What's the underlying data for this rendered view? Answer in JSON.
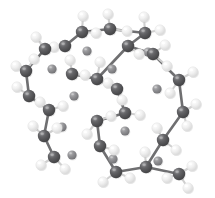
{
  "figure": {
    "kind": "ball-and-stick-molecular-model",
    "background_color": "#ffffff",
    "width": 215,
    "height": 198
  },
  "palette": {
    "carbon_fill": "#58585a",
    "carbon_dark": "#3f3f41",
    "carbon_highlight": "#8d8d90",
    "hydrogen_fill": "#ececec",
    "hydrogen_dark": "#d2d2d2",
    "hydrogen_highlight": "#ffffff",
    "interstitial_fill": "#8b8b8d",
    "interstitial_dark": "#6e6e70",
    "interstitial_highlight": "#b4b4b6",
    "bond_color": "#6f6f71",
    "bond_light": "#cfcfcf"
  },
  "atom_types": {
    "carbon": {
      "label": "C",
      "radius": 6.2,
      "color": "#58585a"
    },
    "hydrogen": {
      "label": "H",
      "radius": 5.2,
      "color": "#ececec"
    },
    "interstitial": {
      "label": "M",
      "radius": 4.6,
      "color": "#8b8b8d"
    }
  },
  "atoms": [
    {
      "id": 0,
      "element": "carbon",
      "x": 82,
      "y": 32
    },
    {
      "id": 1,
      "element": "carbon",
      "x": 110,
      "y": 29
    },
    {
      "id": 2,
      "element": "carbon",
      "x": 145,
      "y": 33
    },
    {
      "id": 3,
      "element": "carbon",
      "x": 45,
      "y": 49
    },
    {
      "id": 4,
      "element": "carbon",
      "x": 65,
      "y": 46
    },
    {
      "id": 5,
      "element": "carbon",
      "x": 128,
      "y": 46
    },
    {
      "id": 6,
      "element": "carbon",
      "x": 153,
      "y": 54
    },
    {
      "id": 7,
      "element": "carbon",
      "x": 26,
      "y": 71
    },
    {
      "id": 8,
      "element": "carbon",
      "x": 72,
      "y": 74
    },
    {
      "id": 9,
      "element": "carbon",
      "x": 97,
      "y": 79
    },
    {
      "id": 10,
      "element": "carbon",
      "x": 117,
      "y": 89
    },
    {
      "id": 11,
      "element": "carbon",
      "x": 179,
      "y": 80
    },
    {
      "id": 12,
      "element": "carbon",
      "x": 29,
      "y": 96
    },
    {
      "id": 13,
      "element": "carbon",
      "x": 49,
      "y": 110
    },
    {
      "id": 14,
      "element": "carbon",
      "x": 125,
      "y": 113
    },
    {
      "id": 15,
      "element": "carbon",
      "x": 183,
      "y": 112
    },
    {
      "id": 16,
      "element": "carbon",
      "x": 44,
      "y": 136
    },
    {
      "id": 17,
      "element": "carbon",
      "x": 97,
      "y": 121
    },
    {
      "id": 18,
      "element": "carbon",
      "x": 100,
      "y": 146
    },
    {
      "id": 19,
      "element": "carbon",
      "x": 54,
      "y": 157
    },
    {
      "id": 20,
      "element": "carbon",
      "x": 163,
      "y": 140
    },
    {
      "id": 21,
      "element": "carbon",
      "x": 116,
      "y": 172
    },
    {
      "id": 22,
      "element": "carbon",
      "x": 146,
      "y": 167
    },
    {
      "id": 23,
      "element": "carbon",
      "x": 179,
      "y": 174
    },
    {
      "id": 24,
      "element": "hydrogen",
      "x": 83,
      "y": 16
    },
    {
      "id": 25,
      "element": "hydrogen",
      "x": 108,
      "y": 14
    },
    {
      "id": 26,
      "element": "hydrogen",
      "x": 144,
      "y": 17
    },
    {
      "id": 27,
      "element": "hydrogen",
      "x": 160,
      "y": 30
    },
    {
      "id": 28,
      "element": "hydrogen",
      "x": 96,
      "y": 33
    },
    {
      "id": 29,
      "element": "hydrogen",
      "x": 127,
      "y": 31
    },
    {
      "id": 30,
      "element": "hydrogen",
      "x": 36,
      "y": 37
    },
    {
      "id": 31,
      "element": "hydrogen",
      "x": 54,
      "y": 47
    },
    {
      "id": 32,
      "element": "hydrogen",
      "x": 70,
      "y": 60
    },
    {
      "id": 33,
      "element": "hydrogen",
      "x": 100,
      "y": 62
    },
    {
      "id": 34,
      "element": "hydrogen",
      "x": 139,
      "y": 54
    },
    {
      "id": 35,
      "element": "hydrogen",
      "x": 165,
      "y": 45
    },
    {
      "id": 36,
      "element": "hydrogen",
      "x": 167,
      "y": 66
    },
    {
      "id": 37,
      "element": "hydrogen",
      "x": 16,
      "y": 66
    },
    {
      "id": 38,
      "element": "hydrogen",
      "x": 34,
      "y": 59
    },
    {
      "id": 39,
      "element": "hydrogen",
      "x": 85,
      "y": 75
    },
    {
      "id": 40,
      "element": "hydrogen",
      "x": 108,
      "y": 83
    },
    {
      "id": 41,
      "element": "hydrogen",
      "x": 193,
      "y": 72
    },
    {
      "id": 42,
      "element": "hydrogen",
      "x": 170,
      "y": 93
    },
    {
      "id": 43,
      "element": "hydrogen",
      "x": 17,
      "y": 87
    },
    {
      "id": 44,
      "element": "hydrogen",
      "x": 40,
      "y": 102
    },
    {
      "id": 45,
      "element": "hydrogen",
      "x": 63,
      "y": 106
    },
    {
      "id": 46,
      "element": "hydrogen",
      "x": 122,
      "y": 100
    },
    {
      "id": 47,
      "element": "hydrogen",
      "x": 140,
      "y": 115
    },
    {
      "id": 48,
      "element": "hydrogen",
      "x": 196,
      "y": 104
    },
    {
      "id": 49,
      "element": "hydrogen",
      "x": 187,
      "y": 126
    },
    {
      "id": 50,
      "element": "hydrogen",
      "x": 33,
      "y": 126
    },
    {
      "id": 51,
      "element": "hydrogen",
      "x": 57,
      "y": 128
    },
    {
      "id": 52,
      "element": "hydrogen",
      "x": 111,
      "y": 116
    },
    {
      "id": 53,
      "element": "hydrogen",
      "x": 87,
      "y": 134
    },
    {
      "id": 54,
      "element": "hydrogen",
      "x": 114,
      "y": 150
    },
    {
      "id": 55,
      "element": "hydrogen",
      "x": 41,
      "y": 165
    },
    {
      "id": 56,
      "element": "hydrogen",
      "x": 65,
      "y": 169
    },
    {
      "id": 57,
      "element": "hydrogen",
      "x": 157,
      "y": 128
    },
    {
      "id": 58,
      "element": "hydrogen",
      "x": 176,
      "y": 150
    },
    {
      "id": 59,
      "element": "hydrogen",
      "x": 103,
      "y": 182
    },
    {
      "id": 60,
      "element": "hydrogen",
      "x": 130,
      "y": 178
    },
    {
      "id": 61,
      "element": "hydrogen",
      "x": 145,
      "y": 152
    },
    {
      "id": 62,
      "element": "hydrogen",
      "x": 167,
      "y": 178
    },
    {
      "id": 63,
      "element": "hydrogen",
      "x": 192,
      "y": 166
    },
    {
      "id": 64,
      "element": "hydrogen",
      "x": 188,
      "y": 188
    },
    {
      "id": 65,
      "element": "interstitial",
      "x": 87,
      "y": 51
    },
    {
      "id": 66,
      "element": "interstitial",
      "x": 112,
      "y": 69
    },
    {
      "id": 67,
      "element": "interstitial",
      "x": 52,
      "y": 69
    },
    {
      "id": 68,
      "element": "interstitial",
      "x": 148,
      "y": 52
    },
    {
      "id": 69,
      "element": "interstitial",
      "x": 157,
      "y": 89
    },
    {
      "id": 70,
      "element": "interstitial",
      "x": 74,
      "y": 96
    },
    {
      "id": 71,
      "element": "interstitial",
      "x": 62,
      "y": 127
    },
    {
      "id": 72,
      "element": "interstitial",
      "x": 72,
      "y": 155
    },
    {
      "id": 73,
      "element": "interstitial",
      "x": 125,
      "y": 131
    },
    {
      "id": 74,
      "element": "interstitial",
      "x": 113,
      "y": 159
    },
    {
      "id": 75,
      "element": "interstitial",
      "x": 158,
      "y": 161
    }
  ],
  "bonds": [
    {
      "from": 0,
      "to": 1
    },
    {
      "from": 1,
      "to": 2
    },
    {
      "from": 0,
      "to": 4
    },
    {
      "from": 4,
      "to": 3
    },
    {
      "from": 3,
      "to": 7
    },
    {
      "from": 7,
      "to": 12
    },
    {
      "from": 12,
      "to": 13
    },
    {
      "from": 13,
      "to": 16
    },
    {
      "from": 16,
      "to": 19
    },
    {
      "from": 2,
      "to": 5
    },
    {
      "from": 5,
      "to": 6
    },
    {
      "from": 6,
      "to": 11
    },
    {
      "from": 11,
      "to": 15
    },
    {
      "from": 15,
      "to": 20
    },
    {
      "from": 20,
      "to": 22
    },
    {
      "from": 22,
      "to": 23
    },
    {
      "from": 5,
      "to": 9
    },
    {
      "from": 8,
      "to": 9
    },
    {
      "from": 9,
      "to": 10
    },
    {
      "from": 10,
      "to": 14
    },
    {
      "from": 14,
      "to": 17
    },
    {
      "from": 17,
      "to": 18
    },
    {
      "from": 18,
      "to": 21
    },
    {
      "from": 21,
      "to": 22
    },
    {
      "from": 0,
      "to": 24
    },
    {
      "from": 1,
      "to": 25
    },
    {
      "from": 2,
      "to": 26
    },
    {
      "from": 2,
      "to": 27
    },
    {
      "from": 0,
      "to": 28
    },
    {
      "from": 1,
      "to": 29
    },
    {
      "from": 3,
      "to": 30
    },
    {
      "from": 4,
      "to": 31
    },
    {
      "from": 8,
      "to": 32
    },
    {
      "from": 9,
      "to": 33
    },
    {
      "from": 5,
      "to": 34
    },
    {
      "from": 6,
      "to": 35
    },
    {
      "from": 6,
      "to": 36
    },
    {
      "from": 7,
      "to": 37
    },
    {
      "from": 7,
      "to": 38
    },
    {
      "from": 8,
      "to": 39
    },
    {
      "from": 10,
      "to": 40
    },
    {
      "from": 11,
      "to": 41
    },
    {
      "from": 11,
      "to": 42
    },
    {
      "from": 12,
      "to": 43
    },
    {
      "from": 13,
      "to": 44
    },
    {
      "from": 13,
      "to": 45
    },
    {
      "from": 10,
      "to": 46
    },
    {
      "from": 14,
      "to": 47
    },
    {
      "from": 15,
      "to": 48
    },
    {
      "from": 15,
      "to": 49
    },
    {
      "from": 16,
      "to": 50
    },
    {
      "from": 16,
      "to": 51
    },
    {
      "from": 17,
      "to": 52
    },
    {
      "from": 17,
      "to": 53
    },
    {
      "from": 18,
      "to": 54
    },
    {
      "from": 19,
      "to": 55
    },
    {
      "from": 19,
      "to": 56
    },
    {
      "from": 20,
      "to": 57
    },
    {
      "from": 20,
      "to": 58
    },
    {
      "from": 21,
      "to": 59
    },
    {
      "from": 21,
      "to": 60
    },
    {
      "from": 22,
      "to": 61
    },
    {
      "from": 23,
      "to": 62
    },
    {
      "from": 23,
      "to": 63
    },
    {
      "from": 23,
      "to": 64
    }
  ]
}
